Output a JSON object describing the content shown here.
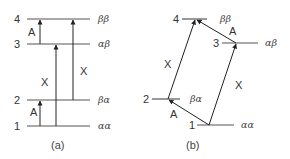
{
  "diagram_a": {
    "caption": "(a)",
    "levels": [
      {
        "number": "4",
        "state": "ββ"
      },
      {
        "number": "3",
        "state": "αβ"
      },
      {
        "number": "2",
        "state": "βα"
      },
      {
        "number": "1",
        "state": "αα"
      }
    ],
    "transitions": [
      {
        "from": "3",
        "to": "4",
        "label": "A"
      },
      {
        "from": "1",
        "to": "3",
        "label": "X"
      },
      {
        "from": "2",
        "to": "4",
        "label": "X"
      },
      {
        "from": "1",
        "to": "2",
        "label": "A"
      }
    ]
  },
  "diagram_b": {
    "caption": "(b)",
    "levels": [
      {
        "number": "4",
        "state": "ββ"
      },
      {
        "number": "3",
        "state": "αβ"
      },
      {
        "number": "2",
        "state": "βα"
      },
      {
        "number": "1",
        "state": "αα"
      }
    ],
    "transitions": [
      {
        "from": "2",
        "to": "4",
        "label": "X"
      },
      {
        "from": "1",
        "to": "3",
        "label": "X"
      },
      {
        "from": "3",
        "to": "4",
        "label": "A"
      },
      {
        "from": "1",
        "to": "2",
        "label": "A"
      }
    ]
  },
  "colors": {
    "line": "#555555",
    "arrow": "#222222",
    "text": "#333333"
  }
}
